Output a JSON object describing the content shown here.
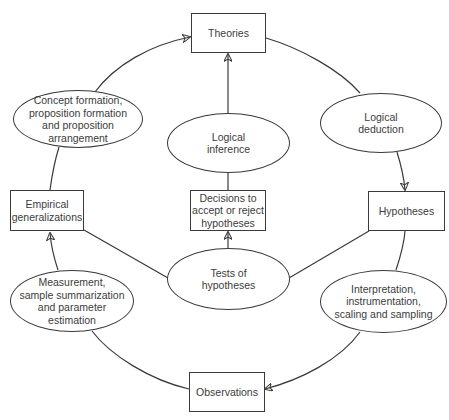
{
  "diagram": {
    "nodes": {
      "theories": {
        "label": "Theories",
        "shape": "box"
      },
      "hypotheses": {
        "label": "Hypotheses",
        "shape": "box"
      },
      "observations": {
        "label": "Observations",
        "shape": "box"
      },
      "empirical_generalizations": {
        "label": "Empirical\ngeneralizations",
        "shape": "box"
      },
      "decisions": {
        "label": "Decisions to\naccept or reject\nhypotheses",
        "shape": "box"
      },
      "logical_deduction": {
        "label": "Logical\ndeduction",
        "shape": "ellipse"
      },
      "logical_inference": {
        "label": "Logical\ninference",
        "shape": "ellipse"
      },
      "concept_formation": {
        "label": "Concept formation,\nproposition formation\nand proposition\narrangement",
        "shape": "ellipse"
      },
      "tests_of_hypotheses": {
        "label": "Tests of\nhypotheses",
        "shape": "ellipse"
      },
      "interpretation": {
        "label": "Interpretation,\ninstrumentation,\nscaling and sampling",
        "shape": "ellipse"
      },
      "measurement": {
        "label": "Measurement,\nsample summarization\nand parameter\nestimation",
        "shape": "ellipse"
      }
    },
    "edges": [
      {
        "from": "theories",
        "to": "logical_deduction",
        "arrow": false
      },
      {
        "from": "logical_deduction",
        "to": "hypotheses",
        "arrow": true
      },
      {
        "from": "hypotheses",
        "to": "interpretation",
        "arrow": false
      },
      {
        "from": "interpretation",
        "to": "observations",
        "arrow": true
      },
      {
        "from": "observations",
        "to": "measurement",
        "arrow": false
      },
      {
        "from": "measurement",
        "to": "empirical_generalizations",
        "arrow": true
      },
      {
        "from": "empirical_generalizations",
        "to": "concept_formation",
        "arrow": false
      },
      {
        "from": "concept_formation",
        "to": "theories",
        "arrow": true
      },
      {
        "from": "hypotheses",
        "to": "tests_of_hypotheses",
        "arrow": false
      },
      {
        "from": "empirical_generalizations",
        "to": "tests_of_hypotheses",
        "arrow": false
      },
      {
        "from": "tests_of_hypotheses",
        "to": "decisions",
        "arrow": true
      },
      {
        "from": "decisions",
        "to": "logical_inference",
        "arrow": false
      },
      {
        "from": "logical_inference",
        "to": "theories",
        "arrow": true
      }
    ],
    "colors": {
      "stroke": "#3a3a3a",
      "text": "#3c3c3c",
      "background": "#ffffff"
    }
  }
}
